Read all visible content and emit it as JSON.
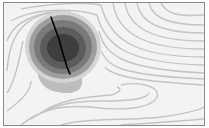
{
  "image": {
    "description": "Grayscale shaded contour map with a dark concentric elliptical depression and a black fracture line",
    "colors": {
      "background": "#f4f4f4",
      "frame": "#8a8a8a",
      "contour_line": "#c8c8c8",
      "ring_outer": "#9a9a9a",
      "ring_mid": "#707070",
      "ring_inner": "#555555",
      "core": "#3a3a3a",
      "fracture": "#000000"
    }
  }
}
